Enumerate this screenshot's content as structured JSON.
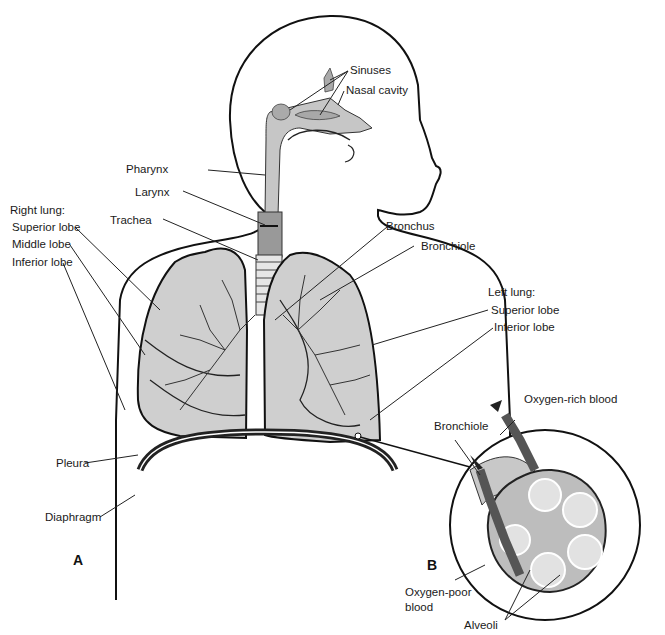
{
  "figure": {
    "panels": [
      {
        "id": "A",
        "label": "A"
      },
      {
        "id": "B",
        "label": "B"
      }
    ],
    "labels": {
      "sinuses": "Sinuses",
      "nasal_cavity": "Nasal cavity",
      "pharynx": "Pharynx",
      "larynx": "Larynx",
      "trachea": "Trachea",
      "right_lung": "Right lung:",
      "right_superior_lobe": "Superior lobe",
      "right_middle_lobe": "Middle lobe",
      "right_inferior_lobe": "Inferior lobe",
      "bronchus": "Bronchus",
      "bronchiole": "Bronchiole",
      "left_lung": "Left lung:",
      "left_superior_lobe": "Superior lobe",
      "left_inferior_lobe": "Inferior lobe",
      "pleura": "Pleura",
      "diaphragm": "Diaphragm",
      "inset_bronchiole": "Bronchiole",
      "oxygen_rich_blood": "Oxygen-rich blood",
      "oxygen_poor_blood_1": "Oxygen-poor",
      "oxygen_poor_blood_2": "blood",
      "alveoli": "Alveoli"
    },
    "colors": {
      "lung_fill": "#cfcfcf",
      "airway_fill": "#bdbdbd",
      "vessel_dark": "#4a4a4a",
      "outline": "#111111"
    }
  }
}
